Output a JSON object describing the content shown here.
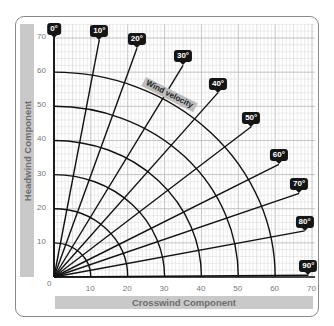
{
  "chart_data": {
    "type": "polar-grid",
    "title": "",
    "xlabel": "Crosswind Component",
    "ylabel": "Headwind Component",
    "xlim": [
      0,
      70
    ],
    "ylim": [
      0,
      70
    ],
    "x_ticks": [
      "0",
      "10",
      "20",
      "30",
      "40",
      "50",
      "60",
      "70"
    ],
    "y_ticks": [
      "10",
      "20",
      "30",
      "40",
      "50",
      "60",
      "70"
    ],
    "grid": true,
    "angle_lines": [
      {
        "label": "0°",
        "angle": 0
      },
      {
        "label": "10°",
        "angle": 10
      },
      {
        "label": "20°",
        "angle": 20
      },
      {
        "label": "30°",
        "angle": 30
      },
      {
        "label": "40°",
        "angle": 40
      },
      {
        "label": "50°",
        "angle": 50
      },
      {
        "label": "60°",
        "angle": 60
      },
      {
        "label": "70°",
        "angle": 70
      },
      {
        "label": "80°",
        "angle": 80
      },
      {
        "label": "90°",
        "angle": 90
      }
    ],
    "velocity_arcs": [
      10,
      20,
      30,
      40,
      50,
      60
    ],
    "arc_annotation": "Wind velocity"
  },
  "colors": {
    "line": "#111111",
    "grid_minor": "#d8d8d8",
    "grid_major": "#b5b5b5",
    "axis_bar": "#c9c9c9",
    "badge": "#151515"
  }
}
